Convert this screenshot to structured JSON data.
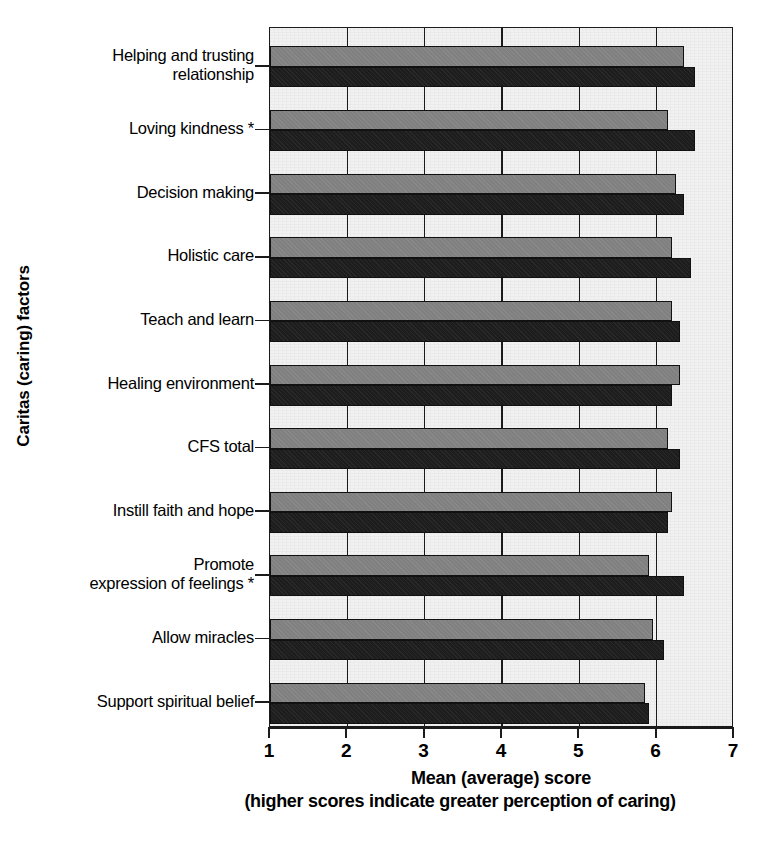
{
  "chart_data": {
    "type": "bar",
    "orientation": "horizontal",
    "title": "",
    "xlabel": "Mean (average) score",
    "xlabel_sub": "(higher scores indicate greater perception of caring)",
    "ylabel": "Caritas (caring) factors",
    "xlim": [
      1,
      7
    ],
    "xticks": [
      1,
      2,
      3,
      4,
      5,
      6,
      7
    ],
    "xtick_labels": [
      "1",
      "2",
      "3",
      "4",
      "5",
      "6",
      "7"
    ],
    "grid": true,
    "legend": "none",
    "categories": [
      "Helping and trusting relationship",
      "Loving kindness *",
      "Decision making",
      "Holistic care",
      "Teach and learn",
      "Healing environment",
      "CFS total",
      "Instill faith and hope",
      "Promote expression of feelings *",
      "Allow miracles",
      "Support spiritual belief"
    ],
    "category_lines": [
      [
        "Helping and trusting",
        "relationship"
      ],
      [
        "Loving kindness *"
      ],
      [
        "Decision making"
      ],
      [
        "Holistic care"
      ],
      [
        "Teach and learn"
      ],
      [
        "Healing environment"
      ],
      [
        "CFS total"
      ],
      [
        "Instill faith and hope"
      ],
      [
        "Promote",
        "expression of feelings *"
      ],
      [
        "Allow miracles"
      ],
      [
        "Support spiritual belief"
      ]
    ],
    "series": [
      {
        "name": "series-a",
        "color": "#808080",
        "values": [
          6.35,
          6.15,
          6.25,
          6.2,
          6.2,
          6.3,
          6.15,
          6.2,
          5.9,
          5.95,
          5.85
        ]
      },
      {
        "name": "series-b",
        "color": "#1d1d1d",
        "values": [
          6.5,
          6.5,
          6.35,
          6.45,
          6.3,
          6.2,
          6.3,
          6.15,
          6.35,
          6.1,
          5.9
        ]
      }
    ],
    "colors": {
      "series_a": "#808080",
      "series_b": "#1d1d1d",
      "plot_background": "#f1f1f1",
      "axis": "#1b1b1b"
    }
  },
  "caption": {
    "fragment": ""
  }
}
